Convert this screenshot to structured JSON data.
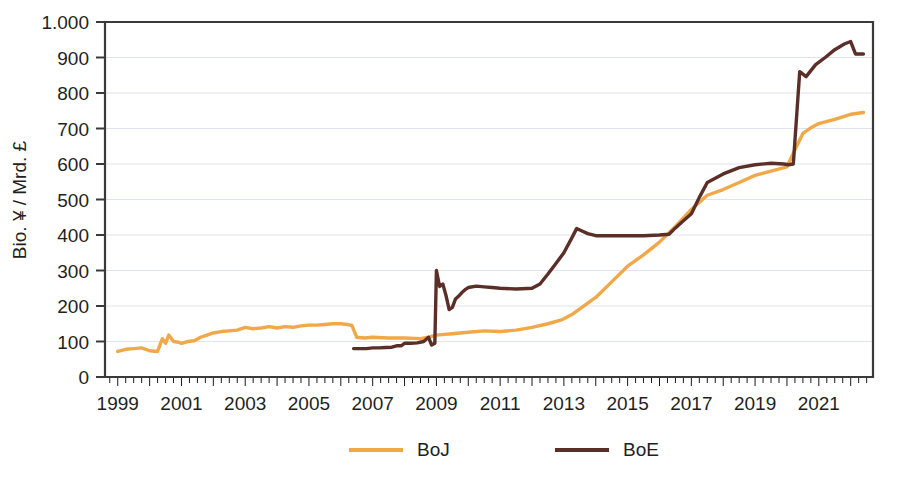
{
  "chart_data": {
    "type": "line",
    "title": "",
    "subtitle": "",
    "xlabel": "",
    "ylabel": "Bio. ¥ / Mrd. £",
    "xlim": [
      1998.6,
      2022.7
    ],
    "ylim": [
      0,
      1000
    ],
    "grid": true,
    "y_ticks": [
      0,
      100,
      200,
      300,
      400,
      500,
      600,
      700,
      800,
      900,
      1000
    ],
    "y_tick_labels": [
      "0",
      "100",
      "200",
      "300",
      "400",
      "500",
      "600",
      "700",
      "800",
      "900",
      "1.000"
    ],
    "x_ticks": [
      1999,
      2001,
      2003,
      2005,
      2007,
      2009,
      2011,
      2013,
      2015,
      2017,
      2019,
      2021
    ],
    "x_tick_labels": [
      "1999",
      "2001",
      "2003",
      "2005",
      "2007",
      "2009",
      "2011",
      "2013",
      "2015",
      "2017",
      "2019",
      "2021"
    ],
    "x_minor_tick_interval": 0.25,
    "legend_position": "bottom",
    "series": [
      {
        "name": "BoJ",
        "color": "#F0A848",
        "x": [
          1999.0,
          1999.25,
          1999.5,
          1999.75,
          2000.0,
          2000.25,
          2000.4,
          2000.5,
          2000.6,
          2000.75,
          2000.9,
          2001.0,
          2001.2,
          2001.4,
          2001.6,
          2001.8,
          2002.0,
          2002.25,
          2002.5,
          2002.75,
          2003.0,
          2003.25,
          2003.5,
          2003.75,
          2004.0,
          2004.25,
          2004.5,
          2004.75,
          2005.0,
          2005.25,
          2005.5,
          2005.75,
          2006.0,
          2006.2,
          2006.35,
          2006.5,
          2006.75,
          2007.0,
          2007.5,
          2008.0,
          2008.5,
          2008.75,
          2009.0,
          2009.25,
          2009.5,
          2010.0,
          2010.5,
          2011.0,
          2011.5,
          2012.0,
          2012.5,
          2012.9,
          2013.0,
          2013.25,
          2013.5,
          2013.75,
          2014.0,
          2014.5,
          2015.0,
          2015.5,
          2016.0,
          2016.5,
          2017.0,
          2017.5,
          2018.0,
          2018.5,
          2019.0,
          2019.5,
          2020.0,
          2020.25,
          2020.5,
          2020.75,
          2021.0,
          2021.5,
          2022.0,
          2022.4
        ],
        "y": [
          72,
          78,
          80,
          82,
          74,
          72,
          108,
          95,
          118,
          100,
          98,
          95,
          100,
          102,
          112,
          118,
          124,
          128,
          130,
          132,
          140,
          136,
          138,
          142,
          138,
          142,
          140,
          144,
          146,
          146,
          148,
          150,
          150,
          148,
          145,
          112,
          110,
          112,
          110,
          110,
          108,
          112,
          118,
          120,
          122,
          126,
          130,
          128,
          132,
          140,
          150,
          160,
          164,
          176,
          192,
          208,
          224,
          268,
          312,
          344,
          380,
          424,
          472,
          512,
          528,
          548,
          568,
          580,
          592,
          640,
          686,
          702,
          714,
          726,
          740,
          745
        ]
      },
      {
        "name": "BoE",
        "color": "#5C2E28",
        "x": [
          2006.4,
          2006.6,
          2006.8,
          2007.0,
          2007.2,
          2007.4,
          2007.6,
          2007.75,
          2007.9,
          2008.0,
          2008.2,
          2008.4,
          2008.6,
          2008.75,
          2008.85,
          2008.95,
          2009.0,
          2009.1,
          2009.2,
          2009.3,
          2009.4,
          2009.5,
          2009.6,
          2009.7,
          2009.8,
          2009.9,
          2010.0,
          2010.25,
          2010.5,
          2010.75,
          2011.0,
          2011.5,
          2012.0,
          2012.25,
          2012.5,
          2012.75,
          2013.0,
          2013.25,
          2013.4,
          2013.5,
          2013.75,
          2014.0,
          2014.5,
          2015.0,
          2015.5,
          2016.0,
          2016.3,
          2016.5,
          2016.75,
          2017.0,
          2017.25,
          2017.5,
          2018.0,
          2018.5,
          2019.0,
          2019.5,
          2019.9,
          2020.05,
          2020.2,
          2020.4,
          2020.6,
          2020.9,
          2021.2,
          2021.5,
          2021.8,
          2022.0,
          2022.15,
          2022.4
        ],
        "y": [
          80,
          80,
          80,
          82,
          82,
          83,
          84,
          88,
          88,
          95,
          95,
          96,
          100,
          112,
          90,
          95,
          300,
          255,
          262,
          230,
          190,
          196,
          220,
          228,
          238,
          246,
          252,
          256,
          254,
          252,
          250,
          248,
          250,
          262,
          290,
          320,
          350,
          392,
          418,
          414,
          404,
          398,
          398,
          398,
          398,
          400,
          402,
          420,
          440,
          460,
          506,
          548,
          572,
          590,
          598,
          602,
          600,
          598,
          600,
          860,
          846,
          880,
          900,
          922,
          938,
          945,
          910,
          910
        ]
      }
    ]
  },
  "legend": {
    "items": [
      {
        "label": "BoJ",
        "color": "#F0A848"
      },
      {
        "label": "BoE",
        "color": "#5C2E28"
      }
    ]
  },
  "axes": {
    "y_title": "Bio. ¥ / Mrd. £"
  }
}
